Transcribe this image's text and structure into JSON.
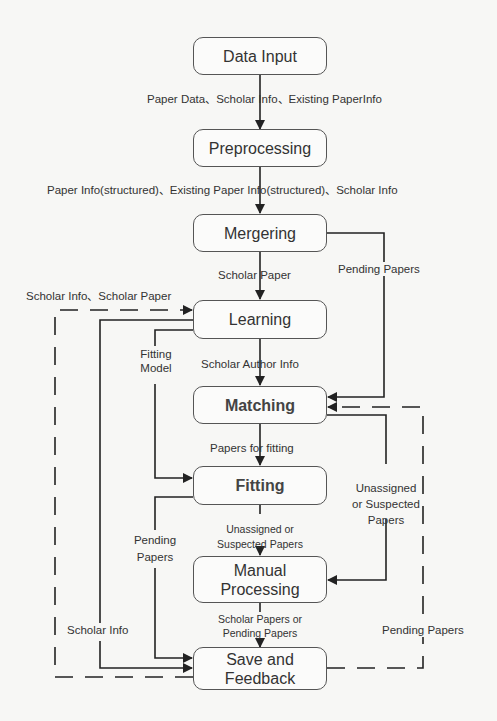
{
  "diagram": {
    "type": "flowchart",
    "colors": {
      "line": "#222222",
      "box_border": "#555555",
      "background": "#f7f7f5",
      "text": "#333333"
    },
    "nodes": [
      {
        "id": "data_input",
        "label": "Data Input"
      },
      {
        "id": "preprocessing",
        "label": "Preprocessing"
      },
      {
        "id": "mergering",
        "label": "Mergering"
      },
      {
        "id": "learning",
        "label": "Learning"
      },
      {
        "id": "matching",
        "label": "Matching"
      },
      {
        "id": "fitting",
        "label": "Fitting"
      },
      {
        "id": "manual_processing",
        "label": "Manual Processing",
        "line1": "Manual",
        "line2": "Processing"
      },
      {
        "id": "save_feedback",
        "label": "Save and Feedback",
        "line1": "Save and",
        "line2": "Feedback"
      }
    ],
    "edges": [
      {
        "from": "data_input",
        "to": "preprocessing",
        "label": "Paper Data、Scholar Info、Existing PaperInfo",
        "style": "solid"
      },
      {
        "from": "preprocessing",
        "to": "mergering",
        "label": "Paper Info(structured)、Existing Paper Info(structured)、Scholar Info",
        "style": "solid"
      },
      {
        "from": "mergering",
        "to": "learning",
        "label": "Scholar Paper",
        "style": "solid"
      },
      {
        "from": "mergering",
        "to": "matching",
        "label": "Pending Papers",
        "style": "solid"
      },
      {
        "from": "save_feedback",
        "to": "learning",
        "label": "Scholar Info、Scholar Paper",
        "style": "dashed"
      },
      {
        "from": "learning",
        "to": "fitting",
        "label": "Fitting Model",
        "line1": "Fitting",
        "line2": "Model",
        "style": "solid"
      },
      {
        "from": "learning",
        "to": "matching",
        "label": "Scholar Author Info",
        "style": "solid"
      },
      {
        "from": "learning",
        "to": "save_feedback",
        "label": "Scholar Info",
        "style": "solid"
      },
      {
        "from": "matching",
        "to": "fitting",
        "label": "Papers for fitting",
        "style": "solid"
      },
      {
        "from": "matching",
        "to": "manual_processing",
        "label": "Unassigned or Suspected Papers",
        "line1": "Unassigned",
        "line2": "or Suspected",
        "line3": "Papers",
        "style": "solid"
      },
      {
        "from": "fitting",
        "to": "manual_processing",
        "label": "Unassigned or Suspected Papers",
        "line1": "Unassigned or",
        "line2": "Suspected Papers",
        "style": "solid"
      },
      {
        "from": "fitting",
        "to": "save_feedback",
        "label": "Pending Papers",
        "line1": "Pending",
        "line2": "Papers",
        "style": "solid"
      },
      {
        "from": "manual_processing",
        "to": "save_feedback",
        "label": "Scholar Papers or Pending Papers",
        "line1": "Scholar Papers or",
        "line2": "Pending Papers",
        "style": "solid"
      },
      {
        "from": "save_feedback",
        "to": "matching",
        "label": "Pending Papers",
        "style": "dashed"
      }
    ]
  }
}
